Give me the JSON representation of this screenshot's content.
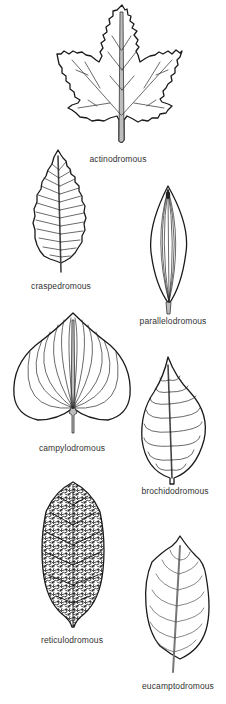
{
  "diagram": {
    "leaves": [
      {
        "id": "actinodromous",
        "label": "actinodromous",
        "label_x": 118,
        "label_y": 154
      },
      {
        "id": "craspedromous",
        "label": "craspedromous",
        "label_x": 61,
        "label_y": 281
      },
      {
        "id": "parallelodromous",
        "label": "parallelodromous",
        "label_x": 173,
        "label_y": 316
      },
      {
        "id": "campylodromous",
        "label": "campylodromous",
        "label_x": 72,
        "label_y": 443
      },
      {
        "id": "brochidodromous",
        "label": "brochidodromous",
        "label_x": 175,
        "label_y": 486
      },
      {
        "id": "reticulodromous",
        "label": "reticulodromous",
        "label_x": 72,
        "label_y": 635
      },
      {
        "id": "eucamptodromous",
        "label": "eucamptodromous",
        "label_x": 178,
        "label_y": 681
      }
    ],
    "colors": {
      "background": "#ffffff",
      "outline": "#1a1a1a",
      "label": "#333333"
    }
  }
}
